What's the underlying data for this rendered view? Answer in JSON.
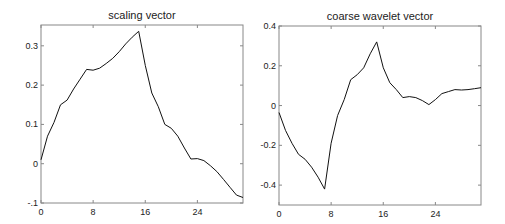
{
  "figure": {
    "background": "#ffffff",
    "line_color": "#111111",
    "axis_color": "#888888"
  },
  "chart_data": [
    {
      "type": "line",
      "title": "scaling vector",
      "xlabel": "",
      "ylabel": "",
      "xlim": [
        0,
        31
      ],
      "ylim": [
        -0.1,
        0.353
      ],
      "xticks": [
        0,
        8,
        16,
        24
      ],
      "xtick_labels": [
        "0",
        "8",
        "16",
        "24"
      ],
      "yticks": [
        -0.1,
        0,
        0.1,
        0.2,
        0.3
      ],
      "ytick_labels": [
        "-.1",
        "0",
        "0.1",
        "0.2",
        "0.3"
      ],
      "grid": false,
      "legend": null,
      "x": [
        0,
        1,
        2,
        3,
        4,
        5,
        6,
        7,
        8,
        9,
        10,
        11,
        12,
        13,
        14,
        15,
        16,
        17,
        18,
        19,
        20,
        21,
        22,
        23,
        24,
        25,
        26,
        27,
        28,
        29,
        30,
        31
      ],
      "series": [
        {
          "name": "scaling vector",
          "values": [
            0.01,
            0.07,
            0.105,
            0.15,
            0.162,
            0.19,
            0.215,
            0.24,
            0.238,
            0.243,
            0.255,
            0.268,
            0.285,
            0.305,
            0.322,
            0.337,
            0.25,
            0.18,
            0.145,
            0.1,
            0.09,
            0.07,
            0.04,
            0.012,
            0.013,
            0.008,
            -0.005,
            -0.02,
            -0.04,
            -0.06,
            -0.08,
            -0.086
          ]
        }
      ],
      "box": {
        "left": 41,
        "top": 25,
        "right": 243,
        "bottom": 203
      }
    },
    {
      "type": "line",
      "title": "coarse wavelet vector",
      "xlabel": "",
      "ylabel": "",
      "xlim": [
        0,
        31
      ],
      "ylim": [
        -0.5,
        0.4
      ],
      "xticks": [
        0,
        8,
        16,
        24
      ],
      "xtick_labels": [
        "0",
        "8",
        "16",
        "24"
      ],
      "yticks": [
        -0.4,
        -0.2,
        0,
        0.2,
        0.4
      ],
      "ytick_labels": [
        "-0.4",
        "-0.2",
        "0",
        "0.2",
        "0.4"
      ],
      "grid": false,
      "legend": null,
      "x": [
        0,
        1,
        2,
        3,
        4,
        5,
        6,
        7,
        8,
        9,
        10,
        11,
        12,
        13,
        14,
        15,
        16,
        17,
        18,
        19,
        20,
        21,
        22,
        23,
        24,
        25,
        26,
        27,
        28,
        29,
        30,
        31
      ],
      "series": [
        {
          "name": "coarse wavelet vector",
          "values": [
            -0.035,
            -0.125,
            -0.19,
            -0.245,
            -0.27,
            -0.31,
            -0.36,
            -0.42,
            -0.19,
            -0.05,
            0.03,
            0.13,
            0.155,
            0.19,
            0.26,
            0.32,
            0.19,
            0.115,
            0.08,
            0.04,
            0.045,
            0.04,
            0.025,
            0.005,
            0.03,
            0.06,
            0.07,
            0.08,
            0.078,
            0.08,
            0.085,
            0.09
          ]
        }
      ],
      "box": {
        "left": 279,
        "top": 26,
        "right": 481,
        "bottom": 205
      }
    }
  ]
}
